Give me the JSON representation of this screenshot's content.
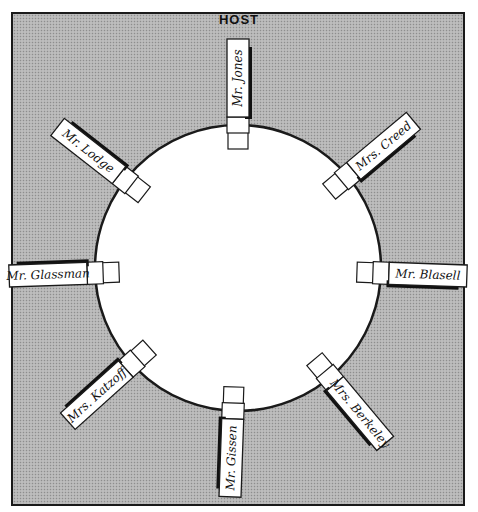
{
  "diagram": {
    "title": "HOST",
    "colors": {
      "background": "#b4b4b4",
      "table": "#ffffff",
      "outline": "#1a1a1a",
      "card": "#ffffff",
      "shadow": "#111111"
    },
    "table": {
      "shape": "circle",
      "cx": 238,
      "cy": 268,
      "r": 143
    },
    "place_cards": [
      {
        "position": "top",
        "name": "Mr. Jones",
        "angle": -90
      },
      {
        "position": "upper-right",
        "name": "Mrs. Creed",
        "angle": -40
      },
      {
        "position": "right",
        "name": "Mr. Blasell",
        "angle": 2
      },
      {
        "position": "lower-right",
        "name": "Mrs. Berkeley",
        "angle": 50
      },
      {
        "position": "bottom",
        "name": "Mr. Gissen",
        "angle": 92
      },
      {
        "position": "lower-left",
        "name": "Mrs. Katzoff",
        "angle": 138
      },
      {
        "position": "left",
        "name": "Mr. Glassman",
        "angle": 178
      },
      {
        "position": "upper-left",
        "name": "Mr. Lodge",
        "angle": -142
      }
    ]
  }
}
